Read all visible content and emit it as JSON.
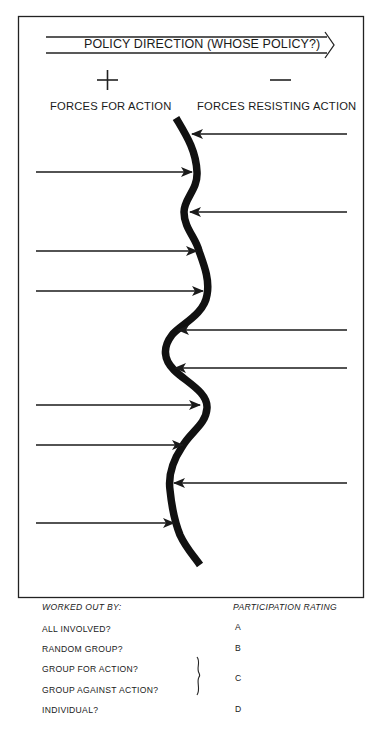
{
  "header": {
    "policy_direction": "POLICY DIRECTION (WHOSE POLICY?)",
    "plus_symbol": "+",
    "minus_symbol": "—",
    "forces_for_label": "FORCES FOR ACTION",
    "forces_resisting_label": "FORCES RESISTING ACTION"
  },
  "diagram": {
    "type": "force-field-analysis",
    "forces_for": [
      {
        "y": 172,
        "tip_x": 192
      },
      {
        "y": 251,
        "tip_x": 197
      },
      {
        "y": 291,
        "tip_x": 203
      },
      {
        "y": 405,
        "tip_x": 200
      },
      {
        "y": 445,
        "tip_x": 183
      },
      {
        "y": 523,
        "tip_x": 173
      }
    ],
    "forces_resisting": [
      {
        "y": 134,
        "tip_x": 193
      },
      {
        "y": 212,
        "tip_x": 191
      },
      {
        "y": 330,
        "tip_x": 178
      },
      {
        "y": 368,
        "tip_x": 175
      },
      {
        "y": 483,
        "tip_x": 174
      }
    ],
    "line_color": "#1a1a1a"
  },
  "footer": {
    "worked_out_by_heading": "WORKED OUT BY:",
    "participation_heading": "PARTICIPATION RATING",
    "rows": [
      {
        "label": "ALL INVOLVED?",
        "rating": "A"
      },
      {
        "label": "RANDOM GROUP?",
        "rating": "B"
      },
      {
        "label": "GROUP FOR ACTION?",
        "rating": ""
      },
      {
        "label": "GROUP AGAINST ACTION?",
        "rating": "C"
      },
      {
        "label": "INDIVIDUAL?",
        "rating": "D"
      }
    ]
  }
}
